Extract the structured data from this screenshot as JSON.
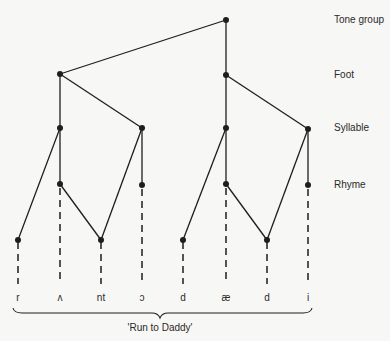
{
  "diagram": {
    "type": "prosodic-hierarchy-tree",
    "levels": [
      {
        "label": "Tone group",
        "y": 20
      },
      {
        "label": "Foot",
        "y": 75
      },
      {
        "label": "Syllable",
        "y": 128
      },
      {
        "label": "Rhyme",
        "y": 184
      }
    ],
    "segments": [
      {
        "symbol": "r",
        "x": 18
      },
      {
        "symbol": "ʌ",
        "x": 60
      },
      {
        "symbol": "nt",
        "x": 101
      },
      {
        "symbol": "ɔ",
        "x": 142
      },
      {
        "symbol": "d",
        "x": 183
      },
      {
        "symbol": "æ",
        "x": 226
      },
      {
        "symbol": "d",
        "x": 267
      },
      {
        "symbol": "i",
        "x": 308
      }
    ],
    "caption": "'Run to Daddy'",
    "colors": {
      "line": "#1e1e1e",
      "background": "#f7f7f5",
      "text": "#2a2a2a"
    }
  }
}
